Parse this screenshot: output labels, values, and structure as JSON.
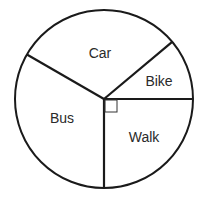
{
  "chart_data": {
    "type": "pie",
    "title": "",
    "categories": [
      "Bike",
      "Car",
      "Bus",
      "Walk"
    ],
    "values_degrees": [
      40,
      110,
      120,
      90
    ],
    "values": [
      40,
      110,
      120,
      90
    ],
    "start_angle_degrees": 0,
    "direction": "counterclockwise",
    "annotations": [
      {
        "type": "right-angle-marker",
        "slice": "Walk",
        "text": ""
      }
    ],
    "legend": "none",
    "labels_inside_slices": true
  },
  "pie": {
    "center": [
      104,
      99
    ],
    "radius": 89,
    "stroke_color": "#1a1a1a",
    "fill_color": "#ffffff",
    "label_color": "#2a2a2a",
    "slices": [
      {
        "label": "Bike",
        "start": 0,
        "end": 40,
        "label_pos": [
          159,
          86
        ]
      },
      {
        "label": "Car",
        "start": 40,
        "end": 150,
        "label_pos": [
          100,
          58
        ]
      },
      {
        "label": "Bus",
        "start": 150,
        "end": 270,
        "label_pos": [
          62,
          123
        ]
      },
      {
        "label": "Walk",
        "start": 270,
        "end": 360,
        "label_pos": [
          144,
          142
        ]
      }
    ],
    "right_angle_marker_size": 12
  }
}
